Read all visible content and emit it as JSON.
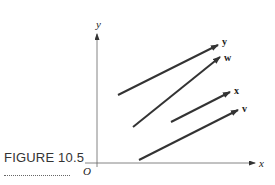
{
  "figure": {
    "caption": "FIGURE 10.5",
    "origin_label": "O",
    "x_axis_label": "x",
    "y_axis_label": "y"
  },
  "vectors": [
    {
      "label": "y",
      "start": [
        118,
        95
      ],
      "end": [
        218,
        45
      ]
    },
    {
      "label": "w",
      "start": [
        133,
        127
      ],
      "end": [
        220,
        57
      ]
    },
    {
      "label": "x",
      "start": [
        171,
        122
      ],
      "end": [
        230,
        92
      ]
    },
    {
      "label": "v",
      "start": [
        139,
        160
      ],
      "end": [
        238,
        110
      ]
    }
  ],
  "colors": {
    "vector": "#333333",
    "axis": "#555555"
  }
}
